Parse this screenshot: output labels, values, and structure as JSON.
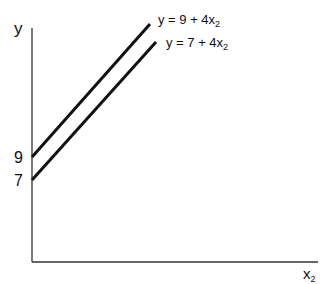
{
  "diagram": {
    "y_axis_label": "y",
    "x_axis_label": "x",
    "x_axis_sub": "2",
    "intercepts": [
      "9",
      "7"
    ],
    "lines": [
      {
        "label_prefix": "y = 9 + 4x",
        "label_sub": "2",
        "intercept": 9,
        "slope": 4
      },
      {
        "label_prefix": "y = 7 + 4x",
        "label_sub": "2",
        "intercept": 7,
        "slope": 4
      }
    ],
    "line_color": "#111111"
  }
}
